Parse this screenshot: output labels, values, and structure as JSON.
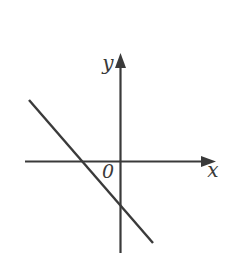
{
  "option_label": "D",
  "figure": {
    "width": 240,
    "height": 266,
    "background": "#ffffff",
    "stroke_color": "#3a3a3a",
    "text_color": "#3a3a3a",
    "option_color": "#2e2e2e",
    "axis_stroke_width": 2.2,
    "x_axis": {
      "label": "x",
      "line": {
        "x1": 25,
        "y1": 161.5,
        "x2": 204,
        "y2": 161.5
      },
      "arrowhead_points": "216,161.5 201,156 201,167",
      "label_x": 213,
      "label_y": 177,
      "label_size": 20
    },
    "y_axis": {
      "label": "y",
      "line": {
        "x1": 120.5,
        "y1": 253,
        "x2": 120.5,
        "y2": 66
      },
      "arrowhead_points": "120.5,53 115,68 126,68",
      "label_x": 108,
      "label_y": 70,
      "label_size": 20
    },
    "origin": {
      "label": "0",
      "label_x": 108,
      "label_y": 178,
      "label_size": 19
    },
    "plotted_line": {
      "x1": 29,
      "y1": 100,
      "x2": 153,
      "y2": 243,
      "stroke_width": 2.4,
      "slope": "negative",
      "x_intercept_position": "left of origin",
      "y_intercept_position": "below origin"
    }
  }
}
